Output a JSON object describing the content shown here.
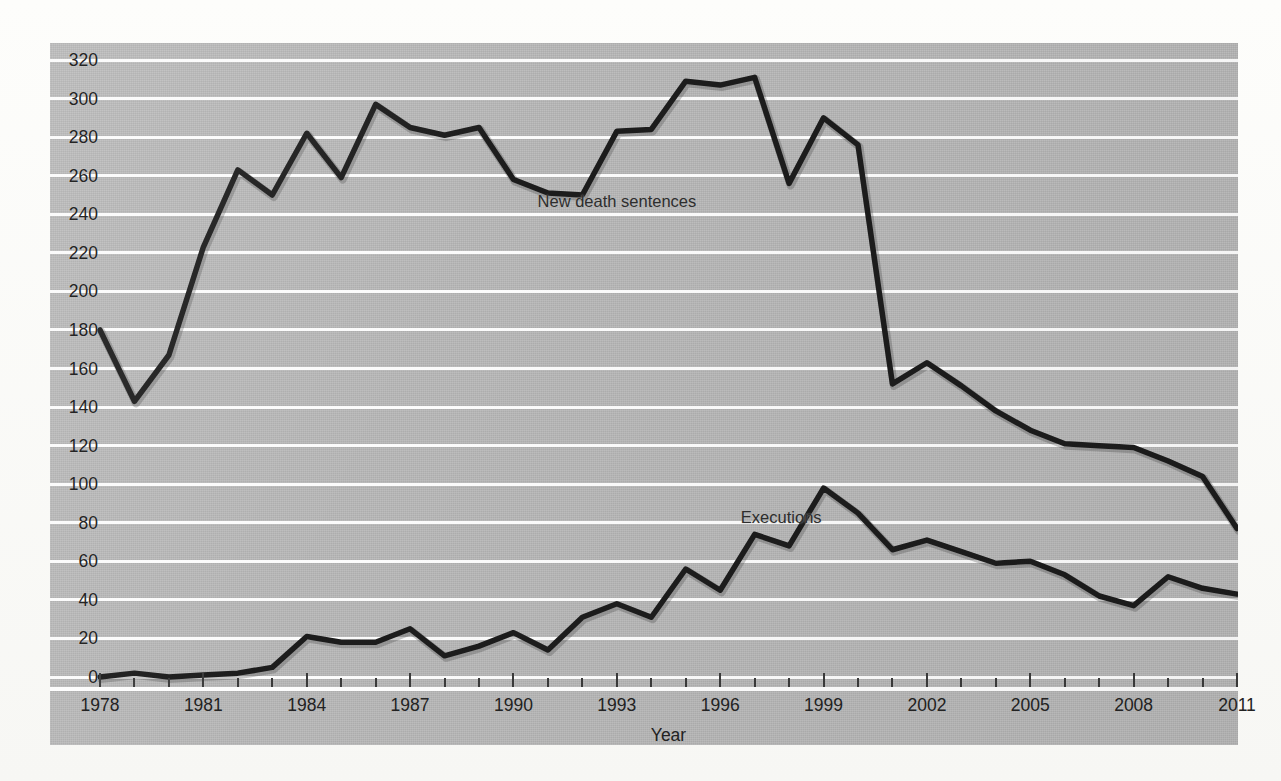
{
  "chart_data": {
    "type": "line",
    "title": "",
    "xlabel": "Year",
    "ylabel": "",
    "xlim": [
      1978,
      2011
    ],
    "ylim": [
      0,
      320
    ],
    "ytick_step": 20,
    "xtick_step": 3,
    "grid": true,
    "legend_position": "inline-annotations",
    "x": [
      1978,
      1979,
      1980,
      1981,
      1982,
      1983,
      1984,
      1985,
      1986,
      1987,
      1988,
      1989,
      1990,
      1991,
      1992,
      1993,
      1994,
      1995,
      1996,
      1997,
      1998,
      1999,
      2000,
      2001,
      2002,
      2003,
      2004,
      2005,
      2006,
      2007,
      2008,
      2009,
      2010,
      2011
    ],
    "series": [
      {
        "name": "New death sentences",
        "values": [
          180,
          143,
          167,
          223,
          263,
          250,
          282,
          259,
          297,
          285,
          281,
          285,
          258,
          251,
          250,
          283,
          284,
          309,
          307,
          311,
          256,
          290,
          276,
          152,
          163,
          151,
          138,
          128,
          121,
          120,
          119,
          112,
          104,
          77
        ]
      },
      {
        "name": "Executions",
        "values": [
          0,
          2,
          0,
          1,
          2,
          5,
          21,
          18,
          18,
          25,
          11,
          16,
          23,
          14,
          31,
          38,
          31,
          56,
          45,
          74,
          68,
          98,
          85,
          66,
          71,
          65,
          59,
          60,
          53,
          42,
          37,
          52,
          46,
          43
        ]
      }
    ],
    "annotations": [
      {
        "text": "New death sentences",
        "x": 1990.7,
        "y": 247
      },
      {
        "text": "Executions",
        "x": 1996.6,
        "y": 83
      }
    ],
    "ytick_labels": [
      "0",
      "20",
      "40",
      "60",
      "80",
      "100",
      "120",
      "140",
      "160",
      "180",
      "200",
      "220",
      "240",
      "260",
      "280",
      "300",
      "320"
    ],
    "xtick_labels": [
      "1978",
      "1981",
      "1984",
      "1987",
      "1990",
      "1993",
      "1996",
      "1999",
      "2002",
      "2005",
      "2008",
      "2011"
    ],
    "colors": {
      "plot_background": "#b9b9b9",
      "gridline": "#fdfdfd",
      "line": "#1c1c1c",
      "text": "#222222",
      "page_background": "#fbfbf9"
    }
  }
}
